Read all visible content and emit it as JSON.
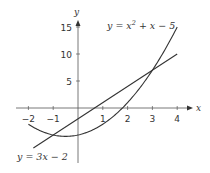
{
  "chart_data": {
    "type": "line",
    "title": "",
    "xlabel": "x",
    "ylabel": "y",
    "xlim": [
      -2.2,
      4.4
    ],
    "ylim": [
      -10,
      17
    ],
    "grid": false,
    "x_ticks": [
      -2,
      -1,
      1,
      2,
      3,
      4
    ],
    "x_tick_labels": [
      "−2",
      "−1",
      "1",
      "2",
      "3",
      "4"
    ],
    "y_ticks": [
      5,
      10,
      15
    ],
    "y_tick_labels": [
      "5",
      "10",
      "15"
    ],
    "series": [
      {
        "name": "y = x² + x − 5",
        "label_main": "y = x",
        "label_sup": "2",
        "label_rest": " + x − 5",
        "expression": "x^2 + x - 5",
        "x_range": [
          -2,
          4
        ],
        "x": [
          -2,
          -1.5,
          -1,
          -0.5,
          0,
          0.5,
          1,
          1.5,
          2,
          2.5,
          3,
          3.5,
          4
        ],
        "y": [
          -3,
          -4.25,
          -5,
          -5.25,
          -5,
          -4.25,
          -3,
          -1.25,
          1,
          3.75,
          7,
          10.75,
          15
        ]
      },
      {
        "name": "y = 3x − 2",
        "expression": "3x - 2",
        "x_range": [
          -1.8,
          4
        ],
        "x": [
          -1.8,
          4
        ],
        "y": [
          -7.4,
          10
        ]
      }
    ],
    "intersections": [
      [
        -1,
        -5
      ],
      [
        3,
        7
      ]
    ],
    "annotations": [
      "y = x² + x − 5",
      "y = 3x − 2"
    ],
    "colors": {
      "curve": "#333333",
      "axis": "#555555",
      "text": "#333333"
    }
  },
  "labels": {
    "x_axis": "x",
    "y_axis": "y",
    "parabola_main": "y = x",
    "parabola_sup": "2",
    "parabola_rest": " + x − 5",
    "line": "y = 3x − 2"
  }
}
